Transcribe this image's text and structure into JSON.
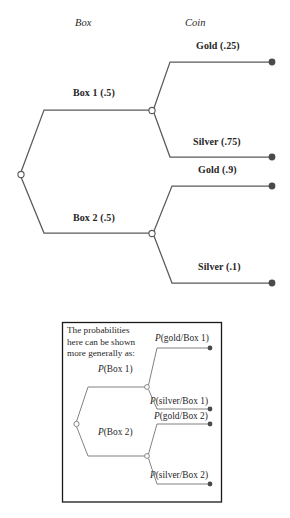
{
  "figure": {
    "title_columns": [
      {
        "id": "box",
        "label": "Box"
      },
      {
        "id": "coin",
        "label": "Coin"
      }
    ],
    "main_tree": {
      "root_label": "",
      "level1": [
        {
          "id": "box1",
          "label": "Box 1 (.5)",
          "outcome": "Box 1",
          "probability": ".5"
        },
        {
          "id": "box2",
          "label": "Box 2 (.5)",
          "outcome": "Box 2",
          "probability": ".5"
        }
      ],
      "level2": [
        {
          "id": "box1-gold",
          "label": "Gold (.25)",
          "outcome": "Gold",
          "probability": ".25",
          "parent": "box1"
        },
        {
          "id": "box1-silver",
          "label": "Silver (.75)",
          "outcome": "Silver",
          "probability": ".75",
          "parent": "box1"
        },
        {
          "id": "box2-gold",
          "label": "Gold (.9)",
          "outcome": "Gold",
          "probability": ".9",
          "parent": "box2"
        },
        {
          "id": "box2-silver",
          "label": "Silver (.1)",
          "outcome": "Silver",
          "probability": ".1",
          "parent": "box2"
        }
      ]
    },
    "inset": {
      "note_lines": [
        "The probabilities",
        "here can be shown",
        "more generally as:"
      ],
      "level1": [
        {
          "id": "p-box1",
          "symbol": "P",
          "argument": "(Box 1)"
        },
        {
          "id": "p-box2",
          "symbol": "P",
          "argument": "(Box 2)"
        }
      ],
      "level2": [
        {
          "id": "p-gold-box1",
          "symbol": "P",
          "argument": "(gold/Box 1)"
        },
        {
          "id": "p-silver-box1",
          "symbol": "P",
          "argument": "(silver/Box 1)"
        },
        {
          "id": "p-gold-box2",
          "symbol": "P",
          "argument": "(gold/Box 2)"
        },
        {
          "id": "p-silver-box2",
          "symbol": "P",
          "argument": "(silver/Box 2)"
        }
      ]
    },
    "colors": {
      "line": "#5a5a5a",
      "endpoint": "#4a4a4a",
      "frame": "#1a1a1a",
      "text": "#231f20",
      "background": "#ffffff"
    }
  }
}
